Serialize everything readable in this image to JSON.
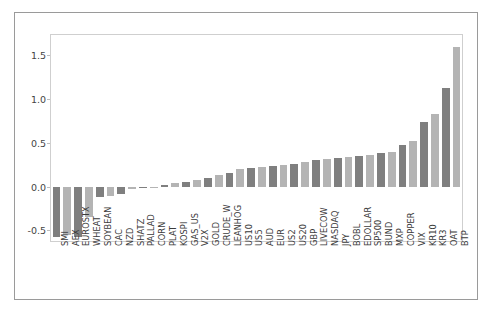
{
  "chart_data": {
    "type": "bar",
    "title": "",
    "xlabel": "",
    "ylabel": "",
    "ylim": [
      -0.62,
      1.73
    ],
    "yticks": [
      -0.5,
      0.0,
      0.5,
      1.0,
      1.5
    ],
    "ytick_labels": [
      "-0.5",
      "0.0",
      "0.5",
      "1.0",
      "1.5"
    ],
    "grid": false,
    "legend": "none",
    "bar_colors": [
      "#7f7f7f",
      "#b4b4b4"
    ],
    "categories": [
      "SMI",
      "AEX",
      "EUROSTX",
      "WHEAT",
      "SOYBEAN",
      "CAC",
      "NZD",
      "SHATZ",
      "PALLAD",
      "CORN",
      "PLAT",
      "KOSPI",
      "GAS_US",
      "V2X",
      "GOLD",
      "CRUDE_W",
      "LEANHOG",
      "US10",
      "US5",
      "AUD",
      "EUR",
      "US2",
      "US20",
      "GBP",
      "LIVECOW",
      "NASDAQ",
      "JPY",
      "BOBL",
      "EDOLLAR",
      "SP500",
      "BUND",
      "MXP",
      "COPPER",
      "VIX",
      "KR10",
      "KR3",
      "OAT",
      "BTP"
    ],
    "values": [
      -0.58,
      -0.55,
      -0.57,
      -0.35,
      -0.12,
      -0.11,
      -0.08,
      -0.03,
      -0.02,
      -0.01,
      0.02,
      0.04,
      0.05,
      0.08,
      0.1,
      0.13,
      0.16,
      0.2,
      0.21,
      0.22,
      0.23,
      0.25,
      0.26,
      0.28,
      0.3,
      0.31,
      0.33,
      0.34,
      0.35,
      0.36,
      0.38,
      0.4,
      0.48,
      0.52,
      0.74,
      0.83,
      1.12,
      1.59
    ]
  }
}
